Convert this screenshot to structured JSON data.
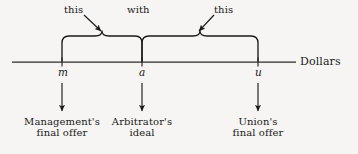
{
  "figure": {
    "type": "number-line-interval-diagram",
    "background_color": "#f6f5f3",
    "ink_color": "#1a1a1a",
    "axis": {
      "label": "Dollars",
      "start_x": 12,
      "end_x": 296,
      "y": 62
    },
    "annotations": {
      "left_label": "this",
      "middle_label": "with",
      "right_label": "this"
    },
    "points": [
      {
        "symbol": "m",
        "x": 62,
        "caption_line1": "Management's",
        "caption_line2": "final offer"
      },
      {
        "symbol": "a",
        "x": 142,
        "caption_line1": "Arbitrator's",
        "caption_line2": "ideal"
      },
      {
        "symbol": "u",
        "x": 258,
        "caption_line1": "Union's",
        "caption_line2": "final offer"
      }
    ],
    "braces": [
      {
        "name": "brace-m-to-a",
        "from": 62,
        "to": 142,
        "peak_x": 102
      },
      {
        "name": "brace-a-to-u",
        "from": 142,
        "to": 258,
        "peak_x": 200
      }
    ]
  }
}
